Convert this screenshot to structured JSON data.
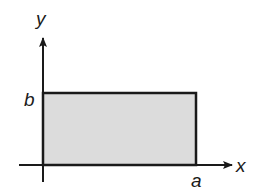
{
  "diagram": {
    "type": "coordinate-rectangle",
    "axes": {
      "x_label": "x",
      "y_label": "y"
    },
    "rectangle": {
      "width_label": "a",
      "height_label": "b",
      "fill_color": "#dcdcdc",
      "stroke_color": "#1a1a1a"
    },
    "colors": {
      "axis": "#1a1a1a",
      "background": "#ffffff"
    }
  }
}
